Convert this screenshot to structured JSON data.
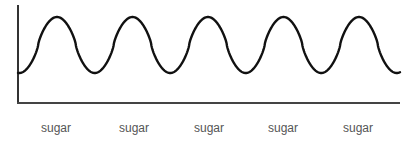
{
  "diagram": {
    "type": "waveform",
    "labels": [
      "sugar",
      "sugar",
      "sugar",
      "sugar",
      "sugar"
    ],
    "label_x": [
      56,
      134,
      209,
      283,
      358
    ],
    "colors": {
      "curve": "#111111",
      "axis": "#333333",
      "label": "#555555"
    }
  }
}
